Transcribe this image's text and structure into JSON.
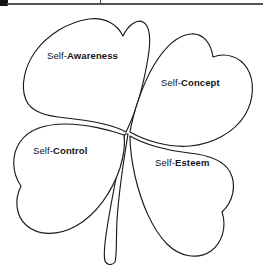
{
  "page": {
    "background_color": "#fbfbfa",
    "width": 263,
    "height": 273
  },
  "header": {
    "rule_color": "#555150",
    "corner_mark_color": "#141313",
    "tick_mark_color": "#4a4746"
  },
  "figure": {
    "name": "four-leaf-clover",
    "stroke_color": "#1a1a1a",
    "fill_color": "#ffffff",
    "petal_count": 4,
    "has_stem": true,
    "petals": [
      {
        "id": "self-awareness",
        "position": "top-left",
        "prefix": "Self-",
        "term": "Awareness"
      },
      {
        "id": "self-concept",
        "position": "top-right",
        "prefix": "Self-",
        "term": "Concept"
      },
      {
        "id": "self-control",
        "position": "bottom-left",
        "prefix": "Self-",
        "term": "Control"
      },
      {
        "id": "self-esteem",
        "position": "bottom-right",
        "prefix": "Self-",
        "term": "Esteem"
      }
    ]
  }
}
